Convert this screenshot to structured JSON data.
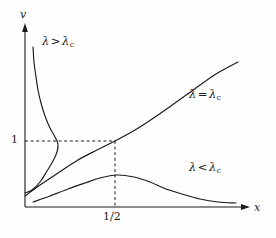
{
  "figure": {
    "type": "line-chart-diagram",
    "background_color": "#fefefe",
    "ink_color": "#1a1a1a"
  },
  "axes": {
    "y_label": "v",
    "x_label": "x",
    "origin": {
      "x": 25,
      "y": 207
    },
    "y_axis_top": {
      "x": 25,
      "y": 25
    },
    "x_axis_right": {
      "x": 250,
      "y": 207
    }
  },
  "ticks": {
    "y": [
      {
        "label": "1",
        "value": 1,
        "pixel_y": 141,
        "label_x": 11,
        "label_y": 135
      }
    ],
    "x": [
      {
        "label": "1/2",
        "value": 0.5,
        "pixel_x": 115,
        "label_x": 104,
        "label_y": 211
      }
    ]
  },
  "guides": [
    {
      "name": "horizontal-guide-v-equals-1",
      "style": "dashed",
      "from": [
        25,
        141
      ],
      "to": [
        115,
        141
      ]
    },
    {
      "name": "vertical-guide-x-equals-half",
      "style": "dashed",
      "from": [
        115,
        141
      ],
      "to": [
        115,
        207
      ]
    }
  ],
  "curve_labels": {
    "greater": {
      "lambda": "λ",
      "relation": ">",
      "sub": "c",
      "x": 42,
      "y": 42
    },
    "equal": {
      "lambda": "λ",
      "relation": "=",
      "sub": "c",
      "x": 190,
      "y": 95
    },
    "less": {
      "lambda": "λ",
      "relation": "<",
      "sub": "c",
      "x": 190,
      "y": 168
    }
  },
  "chart_data": {
    "type": "line",
    "title": "",
    "xlabel": "x",
    "ylabel": "v",
    "xlim": [
      0,
      1.07
    ],
    "ylim": [
      0,
      1.6
    ],
    "xticks": [
      0.5
    ],
    "xticklabels": [
      "1/2"
    ],
    "yticks": [
      1
    ],
    "yticklabels": [
      "1"
    ],
    "grid": false,
    "legend": "inline-annotations",
    "annotations": [
      {
        "text": "λ > λ_c",
        "x": 0.08,
        "y": 1.46
      },
      {
        "text": "λ = λ_c",
        "x": 0.74,
        "y": 1.23
      },
      {
        "text": "λ < λ_c",
        "x": 0.74,
        "y": 0.42
      }
    ],
    "series": [
      {
        "name": "λ > λ_c",
        "description": "S-shaped branch rising steeply from the origin region and bending back toward the y-axis at large v",
        "points_px": [
          [
            33,
            47
          ],
          [
            34,
            62
          ],
          [
            36,
            77
          ],
          [
            38,
            90
          ],
          [
            41,
            103
          ],
          [
            45,
            116
          ],
          [
            50,
            128
          ],
          [
            55,
            137
          ],
          [
            58,
            144
          ],
          [
            57,
            152
          ],
          [
            53,
            161
          ],
          [
            47,
            171
          ],
          [
            40,
            182
          ],
          [
            32,
            190
          ],
          [
            25,
            193
          ]
        ],
        "points_data": [
          [
            0.035,
            1.56
          ],
          [
            0.04,
            1.46
          ],
          [
            0.05,
            1.36
          ],
          [
            0.06,
            1.28
          ],
          [
            0.075,
            1.19
          ],
          [
            0.09,
            1.11
          ],
          [
            0.11,
            1.03
          ],
          [
            0.13,
            0.97
          ],
          [
            0.145,
            0.92
          ],
          [
            0.14,
            0.87
          ],
          [
            0.12,
            0.81
          ],
          [
            0.1,
            0.75
          ],
          [
            0.065,
            0.68
          ],
          [
            0.03,
            0.63
          ],
          [
            0.0,
            0.61
          ]
        ]
      },
      {
        "name": "λ = λ_c",
        "description": "Monotone increasing concave curve passing through (1/2, 1)",
        "points_px": [
          [
            25,
            196
          ],
          [
            40,
            185
          ],
          [
            58,
            173
          ],
          [
            78,
            160
          ],
          [
            97,
            150
          ],
          [
            115,
            141
          ],
          [
            135,
            130
          ],
          [
            155,
            117
          ],
          [
            175,
            103
          ],
          [
            196,
            88
          ],
          [
            216,
            74
          ],
          [
            238,
            62
          ]
        ],
        "points_data": [
          [
            0.0,
            0.07
          ],
          [
            0.067,
            0.145
          ],
          [
            0.147,
            0.23
          ],
          [
            0.236,
            0.32
          ],
          [
            0.32,
            0.39
          ],
          [
            0.4,
            0.45
          ],
          [
            0.49,
            0.53
          ],
          [
            0.58,
            0.62
          ],
          [
            0.67,
            0.72
          ],
          [
            0.76,
            0.82
          ],
          [
            0.85,
            0.92
          ],
          [
            0.95,
            1.01
          ]
        ]
      },
      {
        "name": "λ < λ_c",
        "description": "Rises to a maximum near x = 1/2 then decays asymptotically toward the x-axis",
        "points_px": [
          [
            33,
            202
          ],
          [
            50,
            196
          ],
          [
            68,
            189
          ],
          [
            85,
            183
          ],
          [
            100,
            178
          ],
          [
            117,
            175
          ],
          [
            134,
            177
          ],
          [
            150,
            182
          ],
          [
            166,
            189
          ],
          [
            182,
            194
          ],
          [
            200,
            199
          ],
          [
            218,
            202
          ],
          [
            236,
            203
          ]
        ],
        "points_data": [
          [
            0.035,
            0.02
          ],
          [
            0.11,
            0.07
          ],
          [
            0.19,
            0.12
          ],
          [
            0.27,
            0.16
          ],
          [
            0.33,
            0.2
          ],
          [
            0.41,
            0.22
          ],
          [
            0.48,
            0.21
          ],
          [
            0.56,
            0.17
          ],
          [
            0.63,
            0.12
          ],
          [
            0.7,
            0.09
          ],
          [
            0.78,
            0.05
          ],
          [
            0.86,
            0.03
          ],
          [
            0.94,
            0.02
          ]
        ]
      }
    ]
  }
}
